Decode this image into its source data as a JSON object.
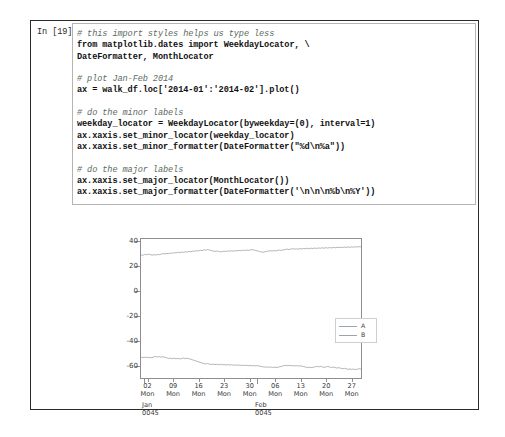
{
  "cell": {
    "prompt_label": "In [19]:",
    "code_lines": [
      {
        "text": "# this import styles helps us type less",
        "kind": "comment"
      },
      {
        "text": "from matplotlib.dates import WeekdayLocator, \\",
        "kind": "code"
      },
      {
        "text": "DateFormatter, MonthLocator",
        "kind": "code"
      },
      {
        "text": "",
        "kind": "blank"
      },
      {
        "text": "# plot Jan-Feb 2014",
        "kind": "comment"
      },
      {
        "text": "ax = walk_df.loc['2014-01':'2014-02'].plot()",
        "kind": "code"
      },
      {
        "text": "",
        "kind": "blank"
      },
      {
        "text": "# do the minor labels",
        "kind": "comment"
      },
      {
        "text": "weekday_locator = WeekdayLocator(byweekday=(0), interval=1)",
        "kind": "code"
      },
      {
        "text": "ax.xaxis.set_minor_locator(weekday_locator)",
        "kind": "code"
      },
      {
        "text": "ax.xaxis.set_minor_formatter(DateFormatter(\"%d\\n%a\"))",
        "kind": "code"
      },
      {
        "text": "",
        "kind": "blank"
      },
      {
        "text": "# do the major labels",
        "kind": "comment"
      },
      {
        "text": "ax.xaxis.set_major_locator(MonthLocator())",
        "kind": "code"
      },
      {
        "text": "ax.xaxis.set_major_formatter(DateFormatter('\\n\\n\\n%b\\n%Y'))",
        "kind": "code"
      }
    ]
  },
  "chart_data": {
    "type": "line",
    "title": "",
    "xlabel": "",
    "ylabel": "",
    "ylim": [
      -70,
      42
    ],
    "yticks": [
      40,
      20,
      0,
      -20,
      -40,
      -60
    ],
    "ytick_labels": [
      "40",
      "20",
      "0",
      "-20",
      "-40",
      "-60"
    ],
    "grid": false,
    "legend_position": "center right",
    "x_minor_ticks": [
      {
        "day": "02",
        "weekday": "Mon",
        "pos": 0.034
      },
      {
        "day": "09",
        "weekday": "Mon",
        "pos": 0.149
      },
      {
        "day": "16",
        "weekday": "Mon",
        "pos": 0.264
      },
      {
        "day": "23",
        "weekday": "Mon",
        "pos": 0.379
      },
      {
        "day": "30",
        "weekday": "Mon",
        "pos": 0.494
      },
      {
        "day": "06",
        "weekday": "Mon",
        "pos": 0.609
      },
      {
        "day": "13",
        "weekday": "Mon",
        "pos": 0.724
      },
      {
        "day": "20",
        "weekday": "Mon",
        "pos": 0.839
      },
      {
        "day": "27",
        "weekday": "Mon",
        "pos": 0.954
      }
    ],
    "x_major_ticks": [
      {
        "month": "Jan",
        "year": "0045",
        "pos": 0.018
      },
      {
        "month": "Feb",
        "year": "0045",
        "pos": 0.527
      }
    ],
    "series": [
      {
        "name": "A",
        "color": "#9aa4ac",
        "values": [
          29.1,
          28.9,
          29.6,
          29.3,
          29.8,
          29.4,
          29.0,
          29.3,
          29.1,
          29.5,
          29.3,
          29.9,
          30.2,
          30.0,
          30.4,
          30.2,
          30.7,
          30.5,
          31.0,
          30.8,
          31.3,
          31.0,
          31.5,
          31.2,
          31.8,
          31.4,
          32.0,
          31.7,
          32.3,
          32.1,
          32.6,
          32.3,
          33.0,
          32.6,
          33.3,
          32.9,
          33.5,
          33.1,
          32.7,
          32.3,
          32.0,
          32.4,
          32.0,
          31.6,
          31.9,
          32.2,
          32.0,
          32.4,
          32.1,
          32.5,
          32.2,
          32.7,
          32.4,
          32.8,
          32.5,
          33.0,
          32.7,
          33.1,
          32.8,
          33.2,
          33.5,
          33.1,
          32.8,
          32.4,
          32.0,
          31.6,
          31.3,
          31.7,
          32.0,
          32.3,
          32.6,
          32.3,
          32.7,
          32.4,
          32.8,
          33.1,
          32.8,
          33.2,
          33.5,
          33.9,
          33.5,
          33.9,
          34.2,
          33.8,
          34.1,
          33.8,
          34.2,
          34.0,
          34.4,
          34.1,
          34.5,
          34.2,
          34.6,
          34.3,
          34.7,
          34.4,
          34.8,
          34.5,
          34.9,
          34.6,
          35.0,
          34.7,
          35.1,
          34.8,
          35.2,
          34.9,
          35.3,
          35.0,
          35.4,
          35.1,
          35.5,
          35.2,
          35.6,
          35.3,
          35.7,
          35.4,
          35.8,
          35.5,
          35.9,
          35.6
        ]
      },
      {
        "name": "B",
        "color": "#9aa4ac",
        "values": [
          -53.2,
          -53.5,
          -53.2,
          -53.6,
          -53.3,
          -53.7,
          -53.4,
          -53.0,
          -52.7,
          -53.1,
          -52.8,
          -53.2,
          -52.9,
          -53.3,
          -53.8,
          -54.3,
          -54.0,
          -54.4,
          -54.1,
          -54.5,
          -54.2,
          -54.6,
          -54.3,
          -54.0,
          -54.4,
          -54.1,
          -54.5,
          -54.9,
          -55.4,
          -55.9,
          -56.4,
          -56.9,
          -57.4,
          -57.9,
          -58.3,
          -58.7,
          -58.4,
          -58.8,
          -59.1,
          -58.8,
          -59.2,
          -58.9,
          -59.3,
          -59.0,
          -59.4,
          -59.1,
          -59.5,
          -59.2,
          -59.6,
          -59.3,
          -59.7,
          -59.4,
          -59.8,
          -59.5,
          -59.9,
          -59.6,
          -60.0,
          -59.7,
          -60.1,
          -59.8,
          -60.2,
          -59.9,
          -60.3,
          -60.0,
          -60.4,
          -60.7,
          -61.0,
          -61.3,
          -61.0,
          -61.4,
          -61.1,
          -61.5,
          -61.2,
          -61.6,
          -61.3,
          -61.0,
          -60.6,
          -60.2,
          -59.8,
          -60.1,
          -59.8,
          -60.2,
          -59.9,
          -60.3,
          -60.0,
          -60.4,
          -60.1,
          -60.5,
          -60.8,
          -61.2,
          -61.6,
          -61.3,
          -61.7,
          -61.4,
          -61.0,
          -60.6,
          -61.0,
          -60.6,
          -61.0,
          -61.4,
          -61.1,
          -60.7,
          -61.1,
          -61.5,
          -61.2,
          -61.6,
          -62.0,
          -61.7,
          -62.1,
          -62.5,
          -62.2,
          -62.6,
          -63.0,
          -62.7,
          -63.1,
          -62.8,
          -63.2,
          -62.9,
          -62.5,
          -62.9
        ]
      }
    ]
  }
}
